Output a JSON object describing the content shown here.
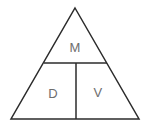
{
  "diagram": {
    "kind": "formula-triangle",
    "background_color": "#ffffff",
    "line_color": "#2b2b2b",
    "line_width": 1.5,
    "text_color": "#6e6e6e",
    "geometry": {
      "apex": {
        "x": 75,
        "y": 8
      },
      "base_left": {
        "x": 11,
        "y": 119
      },
      "base_right": {
        "x": 139,
        "y": 119
      },
      "horizontal_divider": {
        "x1": 44,
        "y1": 63,
        "x2": 107,
        "y2": 63
      },
      "vertical_divider": {
        "x1": 76,
        "y1": 63,
        "x2": 76,
        "y2": 119
      }
    },
    "cells": [
      {
        "id": "top",
        "label": "M",
        "x": 75,
        "y": 47
      },
      {
        "id": "bottom_left",
        "label": "D",
        "x": 53,
        "y": 93
      },
      {
        "id": "bottom_right",
        "label": "V",
        "x": 98,
        "y": 92
      }
    ]
  }
}
